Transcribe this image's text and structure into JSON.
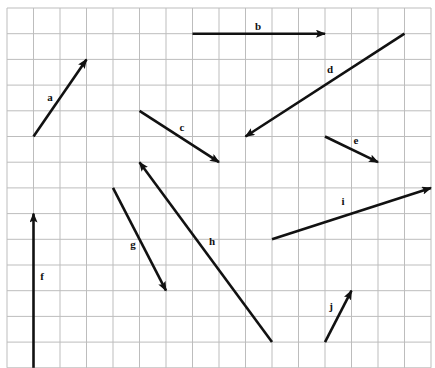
{
  "diagram": {
    "type": "vector-grid",
    "grid": {
      "columns": 16,
      "rows": 14,
      "origin_x": 7,
      "origin_y": 8,
      "cell_w": 26.5,
      "cell_h": 25.7,
      "line_color": "#bdbdbd"
    },
    "arrow_color": "#111111",
    "vectors": [
      {
        "label": "a",
        "from": [
          1,
          5
        ],
        "to": [
          3,
          2
        ],
        "label_pos": [
          50,
          101
        ]
      },
      {
        "label": "b",
        "from": [
          7,
          1
        ],
        "to": [
          12,
          1
        ],
        "label_pos": [
          258,
          30
        ]
      },
      {
        "label": "c",
        "from": [
          5,
          4
        ],
        "to": [
          8,
          6
        ],
        "label_pos": [
          182,
          131
        ]
      },
      {
        "label": "d",
        "from": [
          15,
          1
        ],
        "to": [
          9,
          5
        ],
        "label_pos": [
          330,
          73
        ]
      },
      {
        "label": "e",
        "from": [
          12,
          5
        ],
        "to": [
          14,
          6
        ],
        "label_pos": [
          356,
          144
        ]
      },
      {
        "label": "f",
        "from": [
          1,
          14
        ],
        "to": [
          1,
          8
        ],
        "label_pos": [
          42,
          280
        ]
      },
      {
        "label": "g",
        "from": [
          4,
          7
        ],
        "to": [
          6,
          11
        ],
        "label_pos": [
          133,
          248
        ]
      },
      {
        "label": "h",
        "from": [
          10,
          13
        ],
        "to": [
          5,
          6
        ],
        "label_pos": [
          212,
          245
        ]
      },
      {
        "label": "i",
        "from": [
          10,
          9
        ],
        "to": [
          16,
          7
        ],
        "label_pos": [
          343,
          205
        ]
      },
      {
        "label": "j",
        "from": [
          12,
          13
        ],
        "to": [
          13,
          11
        ],
        "label_pos": [
          331,
          310
        ]
      }
    ]
  }
}
